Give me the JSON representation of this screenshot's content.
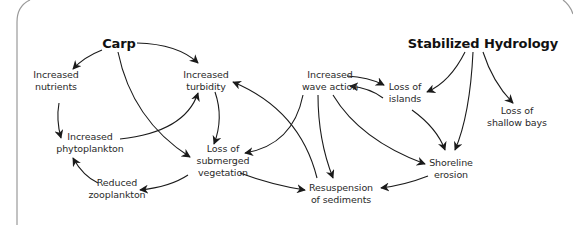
{
  "diagram": {
    "frame_color": "#9a9a9a",
    "arrow_color": "#1a1a1a",
    "nodes": [
      {
        "id": "carp",
        "label": "Carp",
        "x": 119,
        "y": 43,
        "bold": true
      },
      {
        "id": "nutrients",
        "label": "Increased\nnutrients",
        "x": 56,
        "y": 81,
        "bold": false
      },
      {
        "id": "turbidity",
        "label": "Increased\nturbidity",
        "x": 206,
        "y": 81,
        "bold": false
      },
      {
        "id": "phytoplankton",
        "label": "Increased\nphytoplankton",
        "x": 90,
        "y": 143,
        "bold": false
      },
      {
        "id": "vegetation",
        "label": "Loss of\nsubmerged\nvegetation",
        "x": 223,
        "y": 161,
        "bold": false
      },
      {
        "id": "zooplankton",
        "label": "Reduced\nzooplankton",
        "x": 117,
        "y": 189,
        "bold": false
      },
      {
        "id": "sediments",
        "label": "Resuspension\nof sediments",
        "x": 341,
        "y": 194,
        "bold": false
      },
      {
        "id": "wave",
        "label": "Increased\nwave action",
        "x": 330,
        "y": 81,
        "bold": false
      },
      {
        "id": "islands",
        "label": "Loss of\nislands",
        "x": 405,
        "y": 93,
        "bold": false
      },
      {
        "id": "hydrology",
        "label": "Stabilized Hydrology",
        "x": 483,
        "y": 43,
        "bold": true
      },
      {
        "id": "bays",
        "label": "Loss of\nshallow bays",
        "x": 517,
        "y": 117,
        "bold": false
      },
      {
        "id": "shoreline",
        "label": "Shoreline\nerosion",
        "x": 451,
        "y": 169,
        "bold": false
      }
    ],
    "edges": [
      {
        "from": "carp",
        "to": "nutrients",
        "path": "M 102 50 Q 84 57 73 69"
      },
      {
        "from": "carp",
        "to": "turbidity",
        "path": "M 137 43 Q 178 44 198 63"
      },
      {
        "from": "carp",
        "to": "vegetation",
        "path": "M 118 52 Q 132 120 190 157"
      },
      {
        "from": "nutrients",
        "to": "phytoplankton",
        "path": "M 59 103 Q 56 120 61 138"
      },
      {
        "from": "phytoplankton",
        "to": "turbidity",
        "path": "M 120 139 Q 185 132 198 93"
      },
      {
        "from": "turbidity",
        "to": "vegetation",
        "path": "M 215 92 Q 224 118 214 144"
      },
      {
        "from": "vegetation",
        "to": "zooplankton",
        "path": "M 188 175 Q 170 187 140 190"
      },
      {
        "from": "zooplankton",
        "to": "phytoplankton",
        "path": "M 98 183 Q 83 176 73 158"
      },
      {
        "from": "vegetation",
        "to": "sediments",
        "path": "M 240 173 Q 272 185 305 190"
      },
      {
        "from": "sediments",
        "to": "turbidity",
        "path": "M 317 178 Q 300 110 233 82"
      },
      {
        "from": "wave",
        "to": "vegetation",
        "path": "M 303 95 Q 293 145 245 153"
      },
      {
        "from": "wave",
        "to": "sediments",
        "path": "M 318 95 Q 318 140 333 178"
      },
      {
        "from": "wave",
        "to": "shoreline",
        "path": "M 333 95 Q 360 140 425 164"
      },
      {
        "from": "wave",
        "to": "islands",
        "path": "M 347 76 Q 368 77 384 85"
      },
      {
        "from": "islands",
        "to": "wave",
        "path": "M 383 98 Q 370 88 350 86"
      },
      {
        "from": "islands",
        "to": "shoreline",
        "path": "M 412 110 Q 437 128 445 150"
      },
      {
        "from": "hydrology",
        "to": "islands",
        "path": "M 465 52 Q 450 82 427 92"
      },
      {
        "from": "hydrology",
        "to": "shoreline",
        "path": "M 473 52 Q 470 115 455 150"
      },
      {
        "from": "hydrology",
        "to": "bays",
        "path": "M 483 52 Q 493 83 513 103"
      },
      {
        "from": "shoreline",
        "to": "sediments",
        "path": "M 428 176 Q 405 185 381 188"
      }
    ]
  }
}
